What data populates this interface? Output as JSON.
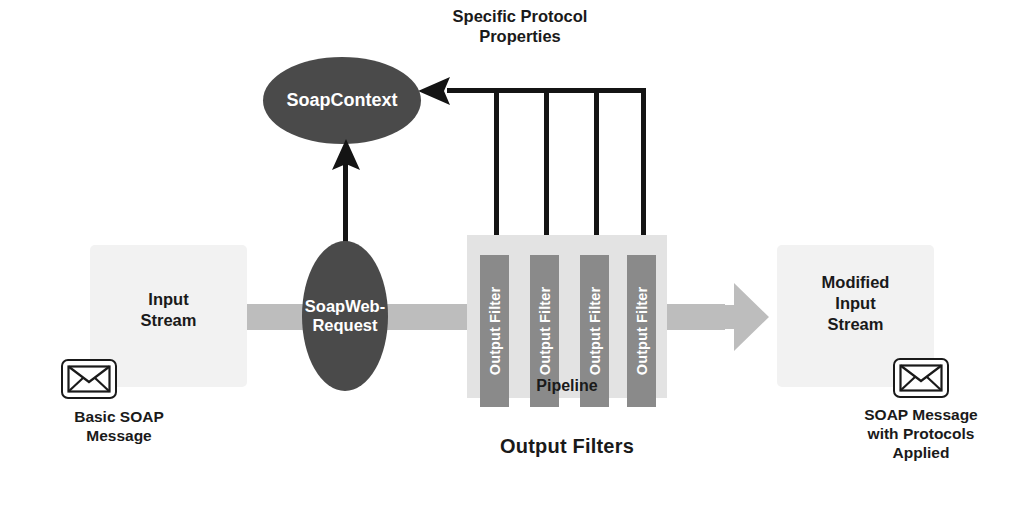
{
  "diagram": {
    "colors": {
      "ellipse_fill": "#4a4a4a",
      "ellipse_text": "#ffffff",
      "filter_fill": "#8a8a8a",
      "pipeline_fill": "#e3e3e3",
      "stream_box_fill": "#f2f2f2",
      "flow_band": "#bdbdbd",
      "connector": "#141414",
      "text": "#1a1a1a",
      "background": "#ffffff"
    },
    "annotations": {
      "specific_protocol_properties": "Specific Protocol\nProperties",
      "output_filters_caption": "Output Filters",
      "pipeline_label": "Pipeline"
    },
    "nodes": {
      "soap_context": "SoapContext",
      "soap_web_request": "SoapWeb-\nRequest",
      "input_stream": "Input\nStream",
      "modified_input_stream": "Modified\nInput\nStream"
    },
    "filters": [
      {
        "label": "Output Filter"
      },
      {
        "label": "Output Filter"
      },
      {
        "label": "Output Filter"
      },
      {
        "label": "Output Filter"
      }
    ],
    "captions": {
      "left_message": "Basic SOAP\nMessage",
      "right_message": "SOAP Message\nwith Protocols\nApplied"
    },
    "icons": {
      "left_envelope": "envelope-icon",
      "right_envelope": "envelope-icon",
      "flow_arrow": "right-arrow-icon",
      "context_arrow": "left-arrow-icon",
      "request_arrow": "up-arrow-icon"
    }
  }
}
